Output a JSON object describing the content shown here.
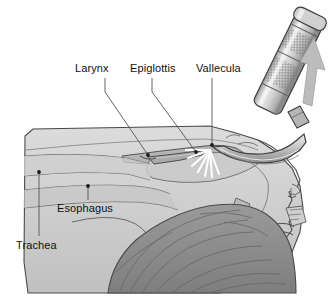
{
  "figure": {
    "kind": "medical-illustration",
    "background_color": "#ffffff"
  },
  "palette": {
    "outline": "#3c3c3c",
    "tissue_light": "#d5d5d5",
    "tissue_mid": "#c4c4c4",
    "tissue_shadow": "#b3b3b3",
    "hair_dark": "#8d8d8d",
    "hair_line": "#6b6b6b",
    "metal_light": "#e2e2e2",
    "metal_mid": "#bdbdbd",
    "metal_dark": "#8f8f8f",
    "arrow": "#b8b8b8",
    "light_ray": "#ffffff",
    "leader": "#555555",
    "text": "#111111"
  },
  "labels": [
    {
      "id": "larynx",
      "text": "Larynx",
      "x": 75,
      "y": 63,
      "anchor_x": 105,
      "anchor_y": 78,
      "tip_x": 148,
      "tip_y": 155,
      "dot": true
    },
    {
      "id": "epiglottis",
      "text": "Epiglottis",
      "x": 130,
      "y": 63,
      "anchor_x": 152,
      "anchor_y": 78,
      "tip_x": 196,
      "tip_y": 152,
      "dot": true
    },
    {
      "id": "vallecula",
      "text": "Vallecula",
      "x": 196,
      "y": 63,
      "anchor_x": 212,
      "anchor_y": 78,
      "tip_x": 212,
      "tip_y": 145,
      "dot": true
    },
    {
      "id": "esophagus",
      "text": "Esophagus",
      "x": 57,
      "y": 203,
      "anchor_x": 88,
      "anchor_y": 200,
      "tip_x": 88,
      "tip_y": 186,
      "dot": true
    },
    {
      "id": "trachea",
      "text": "Trachea",
      "x": 16,
      "y": 240,
      "anchor_x": 39,
      "anchor_y": 236,
      "tip_x": 39,
      "tip_y": 172,
      "dot": true
    }
  ],
  "instrument": {
    "name": "laryngoscope",
    "handle_label": "knurled handle",
    "blade_label": "curved blade",
    "light_label": "blade light",
    "arrow_label": "lift direction arrow",
    "arrow_direction": "up-right"
  }
}
